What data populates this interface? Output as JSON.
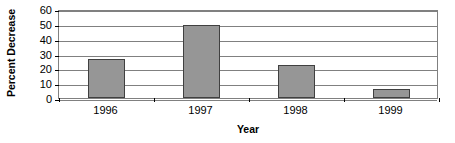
{
  "chart_data": {
    "type": "bar",
    "title": "",
    "xlabel": "Year",
    "ylabel": "Percent Decrease",
    "categories": [
      "1996",
      "1997",
      "1998",
      "1999"
    ],
    "values": [
      26,
      49,
      22,
      6
    ],
    "ylim": [
      0,
      60
    ],
    "yticks": [
      0,
      10,
      20,
      30,
      40,
      50,
      60
    ],
    "ytick_labels": [
      "0",
      "10",
      "20",
      "30",
      "40",
      "50",
      "60"
    ],
    "grid": true,
    "legend": null,
    "legend_position": "none",
    "series": [
      {
        "name": "Percent Decrease",
        "values": [
          26,
          49,
          22,
          6
        ]
      }
    ],
    "colors": {
      "bar_fill": "#969696",
      "bar_border": "#404040",
      "gridline": "#808080",
      "axis": "#808080",
      "text": "#000000",
      "background": "#ffffff"
    }
  }
}
